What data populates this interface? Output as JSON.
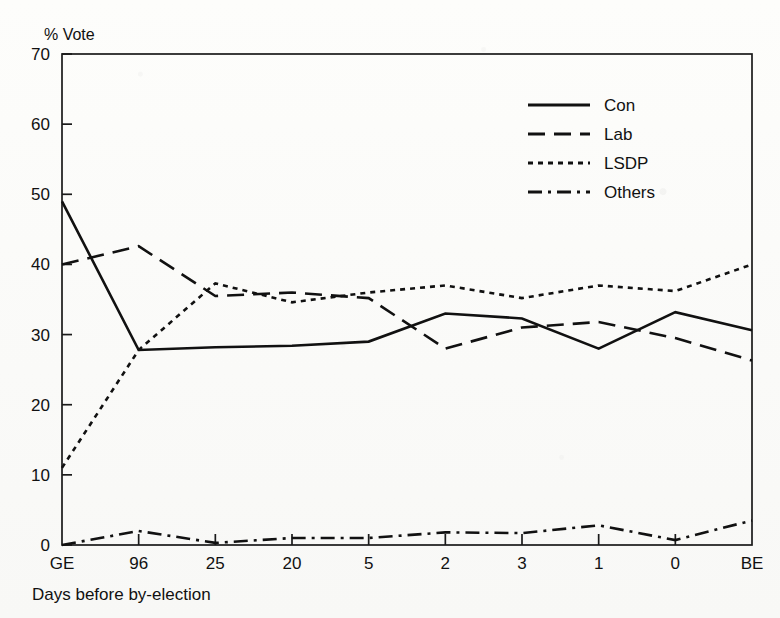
{
  "chart_data": {
    "type": "line",
    "title": "",
    "ylabel": "% Vote",
    "xlabel": "Days before by-election",
    "ylim": [
      0,
      70
    ],
    "yticks": [
      0,
      10,
      20,
      30,
      40,
      50,
      60,
      70
    ],
    "categories": [
      "GE",
      "96",
      "25",
      "20",
      "5",
      "2",
      "3",
      "1",
      "0",
      "BE"
    ],
    "grid": false,
    "legend_position": "top-right",
    "series": [
      {
        "name": "Con",
        "style": "solid",
        "values": [
          49.0,
          27.8,
          28.2,
          28.4,
          29.0,
          33.0,
          32.3,
          28.0,
          33.2,
          30.6
        ]
      },
      {
        "name": "Lab",
        "style": "dashed",
        "values": [
          40.0,
          42.6,
          35.5,
          36.0,
          35.2,
          28.0,
          31.0,
          31.8,
          29.5,
          26.3
        ]
      },
      {
        "name": "LSDP",
        "style": "dotted",
        "values": [
          11.0,
          27.8,
          37.3,
          34.6,
          36.0,
          37.0,
          35.2,
          37.0,
          36.2,
          40.0
        ]
      },
      {
        "name": "Others",
        "style": "dash-dot",
        "values": [
          0.0,
          2.0,
          0.3,
          1.0,
          1.0,
          1.8,
          1.7,
          2.8,
          0.7,
          3.5
        ]
      }
    ]
  },
  "axis": {
    "y_title": "% Vote",
    "x_caption": "Days before by-election"
  }
}
